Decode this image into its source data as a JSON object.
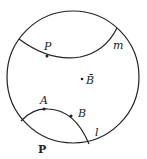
{
  "diagram": {
    "type": "poincare-disk",
    "disk": {
      "cx": 73,
      "cy": 77,
      "r": 66
    },
    "lines": [
      {
        "name": "m",
        "label": "m"
      },
      {
        "name": "l",
        "label": "l"
      }
    ],
    "points": [
      {
        "name": "P_top",
        "label": "P"
      },
      {
        "name": "A",
        "label": "A"
      },
      {
        "name": "B",
        "label": "B"
      },
      {
        "name": "B_bar",
        "label": "B̄"
      }
    ],
    "region_label": "P",
    "colors": {
      "stroke": "#222222",
      "background": "#ffffff"
    }
  }
}
